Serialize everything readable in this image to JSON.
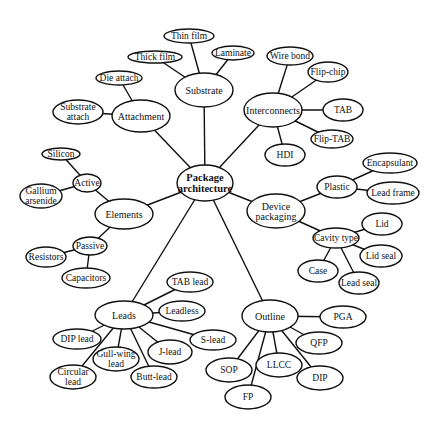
{
  "diagram": {
    "nodes": [
      {
        "id": "root",
        "label": [
          "Package",
          "architecture"
        ],
        "cx": 205,
        "cy": 183,
        "rx": 28,
        "ry": 18,
        "kind": "root"
      },
      {
        "id": "substrate",
        "label": [
          "Substrate"
        ],
        "cx": 204,
        "cy": 90,
        "rx": 29,
        "ry": 17,
        "kind": "mid"
      },
      {
        "id": "thin-film",
        "label": [
          "Thin film"
        ],
        "cx": 189,
        "cy": 36,
        "rx": 25,
        "ry": 7,
        "kind": "leaf"
      },
      {
        "id": "thick-film",
        "label": [
          "Thick film"
        ],
        "cx": 155,
        "cy": 57,
        "rx": 27,
        "ry": 6,
        "kind": "leaf"
      },
      {
        "id": "laminate",
        "label": [
          "Laminate"
        ],
        "cx": 233,
        "cy": 53,
        "rx": 21,
        "ry": 7,
        "kind": "leaf"
      },
      {
        "id": "attachment",
        "label": [
          "Attachment"
        ],
        "cx": 141,
        "cy": 116,
        "rx": 29,
        "ry": 16,
        "kind": "mid"
      },
      {
        "id": "die-attach",
        "label": [
          "Die attach"
        ],
        "cx": 119,
        "cy": 78,
        "rx": 23,
        "ry": 7,
        "kind": "leaf"
      },
      {
        "id": "substrate-attach",
        "label": [
          "Substrate",
          "attach"
        ],
        "cx": 78,
        "cy": 112,
        "rx": 25,
        "ry": 12,
        "kind": "leaf"
      },
      {
        "id": "elements",
        "label": [
          "Elements"
        ],
        "cx": 124,
        "cy": 214,
        "rx": 29,
        "ry": 15,
        "kind": "mid"
      },
      {
        "id": "active",
        "label": [
          "Active"
        ],
        "cx": 87,
        "cy": 183,
        "rx": 14,
        "ry": 9,
        "kind": "leaf"
      },
      {
        "id": "silicon",
        "label": [
          "Silicon"
        ],
        "cx": 61,
        "cy": 154,
        "rx": 19,
        "ry": 6,
        "kind": "leaf"
      },
      {
        "id": "gallium-arsenide",
        "label": [
          "Gallium",
          "arsenide"
        ],
        "cx": 41,
        "cy": 196,
        "rx": 21,
        "ry": 12,
        "kind": "leaf"
      },
      {
        "id": "passive",
        "label": [
          "Passive"
        ],
        "cx": 90,
        "cy": 246,
        "rx": 17,
        "ry": 9,
        "kind": "leaf"
      },
      {
        "id": "resistors",
        "label": [
          "Resistors"
        ],
        "cx": 46,
        "cy": 257,
        "rx": 20,
        "ry": 10,
        "kind": "leaf"
      },
      {
        "id": "capacitors",
        "label": [
          "Capacitors"
        ],
        "cx": 86,
        "cy": 278,
        "rx": 24,
        "ry": 10,
        "kind": "leaf"
      },
      {
        "id": "interconnects",
        "label": [
          "Interconnects"
        ],
        "cx": 273,
        "cy": 110,
        "rx": 29,
        "ry": 17,
        "kind": "mid"
      },
      {
        "id": "wire-bond",
        "label": [
          "Wire bond"
        ],
        "cx": 290,
        "cy": 56,
        "rx": 23,
        "ry": 9,
        "kind": "leaf"
      },
      {
        "id": "flip-chip",
        "label": [
          "Flip-chip"
        ],
        "cx": 328,
        "cy": 72,
        "rx": 20,
        "ry": 10,
        "kind": "leaf"
      },
      {
        "id": "tab",
        "label": [
          "TAB"
        ],
        "cx": 343,
        "cy": 110,
        "rx": 20,
        "ry": 11,
        "kind": "leaf"
      },
      {
        "id": "flip-tab",
        "label": [
          "Flip-TAB"
        ],
        "cx": 332,
        "cy": 139,
        "rx": 21,
        "ry": 9,
        "kind": "leaf"
      },
      {
        "id": "hdi",
        "label": [
          "HDI"
        ],
        "cx": 285,
        "cy": 155,
        "rx": 20,
        "ry": 11,
        "kind": "leaf"
      },
      {
        "id": "device-packaging",
        "label": [
          "Device",
          "packaging"
        ],
        "cx": 276,
        "cy": 211,
        "rx": 29,
        "ry": 17,
        "kind": "mid"
      },
      {
        "id": "plastic",
        "label": [
          "Plastic"
        ],
        "cx": 337,
        "cy": 187,
        "rx": 20,
        "ry": 11,
        "kind": "leaf"
      },
      {
        "id": "encapsulant",
        "label": [
          "Encapsulant"
        ],
        "cx": 390,
        "cy": 163,
        "rx": 27,
        "ry": 10,
        "kind": "leaf"
      },
      {
        "id": "lead-frame",
        "label": [
          "Lead frame"
        ],
        "cx": 393,
        "cy": 193,
        "rx": 26,
        "ry": 11,
        "kind": "leaf"
      },
      {
        "id": "cavity-type",
        "label": [
          "Cavity type"
        ],
        "cx": 336,
        "cy": 238,
        "rx": 23,
        "ry": 10,
        "kind": "leaf"
      },
      {
        "id": "lid",
        "label": [
          "Lid"
        ],
        "cx": 382,
        "cy": 224,
        "rx": 20,
        "ry": 11,
        "kind": "leaf"
      },
      {
        "id": "lid-seal",
        "label": [
          "Lid seal"
        ],
        "cx": 381,
        "cy": 256,
        "rx": 21,
        "ry": 11,
        "kind": "leaf"
      },
      {
        "id": "case",
        "label": [
          "Case"
        ],
        "cx": 318,
        "cy": 271,
        "rx": 20,
        "ry": 11,
        "kind": "leaf"
      },
      {
        "id": "lead-seal",
        "label": [
          "Lead seal"
        ],
        "cx": 359,
        "cy": 283,
        "rx": 20,
        "ry": 11,
        "kind": "leaf"
      },
      {
        "id": "leads",
        "label": [
          "Leads"
        ],
        "cx": 124,
        "cy": 315,
        "rx": 29,
        "ry": 14,
        "kind": "mid"
      },
      {
        "id": "tab-lead",
        "label": [
          "TAB lead"
        ],
        "cx": 190,
        "cy": 282,
        "rx": 23,
        "ry": 10,
        "kind": "leaf"
      },
      {
        "id": "leadless",
        "label": [
          "Leadless"
        ],
        "cx": 182,
        "cy": 311,
        "rx": 23,
        "ry": 10,
        "kind": "leaf"
      },
      {
        "id": "s-lead",
        "label": [
          "S-lead"
        ],
        "cx": 213,
        "cy": 340,
        "rx": 23,
        "ry": 10,
        "kind": "leaf"
      },
      {
        "id": "dip-lead",
        "label": [
          "DIP lead"
        ],
        "cx": 77,
        "cy": 339,
        "rx": 24,
        "ry": 10,
        "kind": "leaf"
      },
      {
        "id": "gull-wing-lead",
        "label": [
          "Gull-wing",
          "lead"
        ],
        "cx": 116,
        "cy": 359,
        "rx": 23,
        "ry": 12,
        "kind": "leaf"
      },
      {
        "id": "j-lead",
        "label": [
          "J-lead"
        ],
        "cx": 170,
        "cy": 352,
        "rx": 22,
        "ry": 12,
        "kind": "leaf"
      },
      {
        "id": "circular-lead",
        "label": [
          "Circular",
          "lead"
        ],
        "cx": 73,
        "cy": 377,
        "rx": 23,
        "ry": 12,
        "kind": "leaf"
      },
      {
        "id": "butt-lead",
        "label": [
          "Butt-lead"
        ],
        "cx": 154,
        "cy": 377,
        "rx": 23,
        "ry": 11,
        "kind": "leaf"
      },
      {
        "id": "outline",
        "label": [
          "Outline"
        ],
        "cx": 270,
        "cy": 316,
        "rx": 28,
        "ry": 16,
        "kind": "mid"
      },
      {
        "id": "pga",
        "label": [
          "PGA"
        ],
        "cx": 343,
        "cy": 317,
        "rx": 23,
        "ry": 11,
        "kind": "leaf"
      },
      {
        "id": "qfp",
        "label": [
          "QFP"
        ],
        "cx": 319,
        "cy": 343,
        "rx": 23,
        "ry": 11,
        "kind": "leaf"
      },
      {
        "id": "sop",
        "label": [
          "SOP"
        ],
        "cx": 229,
        "cy": 370,
        "rx": 23,
        "ry": 12,
        "kind": "leaf"
      },
      {
        "id": "llcc",
        "label": [
          "LLCC"
        ],
        "cx": 279,
        "cy": 365,
        "rx": 23,
        "ry": 12,
        "kind": "leaf"
      },
      {
        "id": "dip",
        "label": [
          "DIP"
        ],
        "cx": 320,
        "cy": 378,
        "rx": 23,
        "ry": 12,
        "kind": "leaf"
      },
      {
        "id": "fp",
        "label": [
          "FP"
        ],
        "cx": 248,
        "cy": 397,
        "rx": 23,
        "ry": 12,
        "kind": "leaf"
      }
    ],
    "edges": [
      [
        "root",
        "substrate"
      ],
      [
        "root",
        "attachment"
      ],
      [
        "root",
        "elements"
      ],
      [
        "root",
        "interconnects"
      ],
      [
        "root",
        "device-packaging"
      ],
      [
        "root",
        "leads"
      ],
      [
        "root",
        "outline"
      ],
      [
        "substrate",
        "thin-film"
      ],
      [
        "substrate",
        "thick-film"
      ],
      [
        "substrate",
        "laminate"
      ],
      [
        "attachment",
        "die-attach"
      ],
      [
        "attachment",
        "substrate-attach"
      ],
      [
        "elements",
        "active"
      ],
      [
        "elements",
        "passive"
      ],
      [
        "active",
        "silicon"
      ],
      [
        "active",
        "gallium-arsenide"
      ],
      [
        "passive",
        "resistors"
      ],
      [
        "passive",
        "capacitors"
      ],
      [
        "interconnects",
        "wire-bond"
      ],
      [
        "interconnects",
        "flip-chip"
      ],
      [
        "interconnects",
        "tab"
      ],
      [
        "interconnects",
        "flip-tab"
      ],
      [
        "interconnects",
        "hdi"
      ],
      [
        "device-packaging",
        "plastic"
      ],
      [
        "device-packaging",
        "cavity-type"
      ],
      [
        "plastic",
        "encapsulant"
      ],
      [
        "plastic",
        "lead-frame"
      ],
      [
        "cavity-type",
        "lid"
      ],
      [
        "cavity-type",
        "lid-seal"
      ],
      [
        "cavity-type",
        "case"
      ],
      [
        "cavity-type",
        "lead-seal"
      ],
      [
        "leads",
        "tab-lead"
      ],
      [
        "leads",
        "leadless"
      ],
      [
        "leads",
        "s-lead"
      ],
      [
        "leads",
        "j-lead"
      ],
      [
        "leads",
        "butt-lead"
      ],
      [
        "leads",
        "gull-wing-lead"
      ],
      [
        "leads",
        "circular-lead"
      ],
      [
        "leads",
        "dip-lead"
      ],
      [
        "outline",
        "pga"
      ],
      [
        "outline",
        "qfp"
      ],
      [
        "outline",
        "dip"
      ],
      [
        "outline",
        "llcc"
      ],
      [
        "outline",
        "fp"
      ],
      [
        "outline",
        "sop"
      ]
    ]
  }
}
